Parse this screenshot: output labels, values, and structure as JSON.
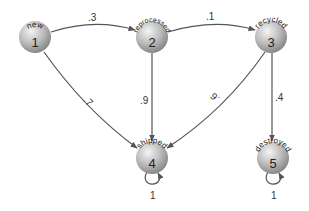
{
  "diagram": {
    "type": "markov-chain",
    "colors": {
      "node_light": "#f2f2f2",
      "node_dark": "#8c8c8c",
      "edge": "#555555",
      "text": "#222222"
    },
    "nodes": [
      {
        "id": "1",
        "name": "new",
        "number": "1"
      },
      {
        "id": "2",
        "name": "reprocessed",
        "number": "2"
      },
      {
        "id": "3",
        "name": "recycled",
        "number": "3"
      },
      {
        "id": "4",
        "name": "shipped",
        "number": "4"
      },
      {
        "id": "5",
        "name": "destroyed",
        "number": "5"
      }
    ],
    "edges": [
      {
        "from": "1",
        "to": "2",
        "label": ".3"
      },
      {
        "from": "2",
        "to": "3",
        "label": ".1"
      },
      {
        "from": "1",
        "to": "4",
        "label": ".7"
      },
      {
        "from": "2",
        "to": "4",
        "label": ".9"
      },
      {
        "from": "3",
        "to": "4",
        "label": ".6"
      },
      {
        "from": "3",
        "to": "5",
        "label": ".4"
      },
      {
        "from": "4",
        "to": "4",
        "label": "1"
      },
      {
        "from": "5",
        "to": "5",
        "label": "1"
      }
    ]
  }
}
